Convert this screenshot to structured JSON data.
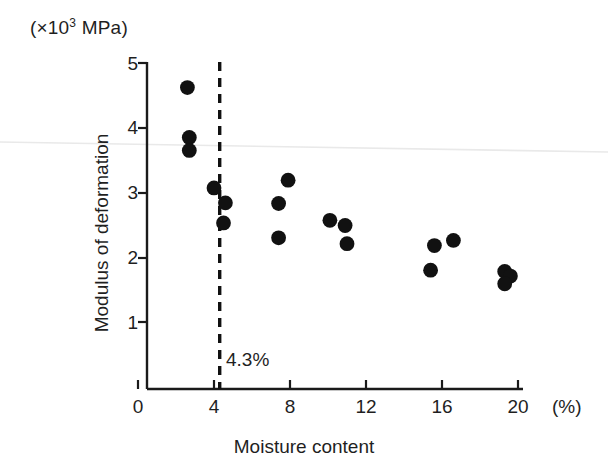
{
  "chart_data": {
    "type": "scatter",
    "title": "",
    "xlabel": "Moisture content",
    "ylabel": "Modulus of deformation",
    "x_unit": "(%)",
    "y_unit": "(×10³ MPa)",
    "y_unit_prefix": "(×10",
    "y_unit_exponent": "3",
    "y_unit_suffix": " MPa)",
    "xlim": [
      0,
      20
    ],
    "ylim": [
      0,
      5
    ],
    "xticks": [
      0,
      4,
      8,
      12,
      16,
      20
    ],
    "xtick_labels": [
      "0",
      "4",
      "8",
      "12",
      "16",
      "20"
    ],
    "yticks": [
      1,
      2,
      3,
      4,
      5
    ],
    "ytick_labels": [
      "1",
      "2",
      "3",
      "4",
      "5"
    ],
    "grid": false,
    "legend": null,
    "marker": "filled-circle",
    "marker_color": "#111111",
    "axis_color": "#1a1a1a",
    "annotations": [
      {
        "name": "moisture-threshold",
        "text": "4.3%",
        "type": "vertical-dashed-line",
        "x": 4.3,
        "style": "dashed"
      }
    ],
    "points": [
      {
        "x": 2.6,
        "y": 4.62
      },
      {
        "x": 2.7,
        "y": 3.85
      },
      {
        "x": 2.7,
        "y": 3.65
      },
      {
        "x": 4.0,
        "y": 3.07
      },
      {
        "x": 4.6,
        "y": 2.84
      },
      {
        "x": 4.5,
        "y": 2.53
      },
      {
        "x": 7.9,
        "y": 3.19
      },
      {
        "x": 7.4,
        "y": 2.83
      },
      {
        "x": 7.4,
        "y": 2.3
      },
      {
        "x": 10.1,
        "y": 2.57
      },
      {
        "x": 10.9,
        "y": 2.49
      },
      {
        "x": 11.0,
        "y": 2.21
      },
      {
        "x": 15.6,
        "y": 2.18
      },
      {
        "x": 16.6,
        "y": 2.26
      },
      {
        "x": 15.4,
        "y": 1.8
      },
      {
        "x": 19.3,
        "y": 1.78
      },
      {
        "x": 19.6,
        "y": 1.71
      },
      {
        "x": 19.3,
        "y": 1.59
      }
    ]
  }
}
